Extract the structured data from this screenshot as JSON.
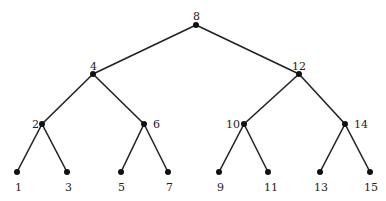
{
  "diagram": {
    "type": "binary-search-tree",
    "edge_color": "#222222",
    "node_color": "#111111",
    "nodes": [
      {
        "id": "n8",
        "label": "8",
        "x": 196,
        "y": 25,
        "lx": 193,
        "ly": 11
      },
      {
        "id": "n4",
        "label": "4",
        "x": 93,
        "y": 74,
        "lx": 90,
        "ly": 61
      },
      {
        "id": "n12",
        "label": "12",
        "x": 299,
        "y": 74,
        "lx": 292,
        "ly": 61
      },
      {
        "id": "n2",
        "label": "2",
        "x": 42,
        "y": 124,
        "lx": 32,
        "ly": 119
      },
      {
        "id": "n6",
        "label": "6",
        "x": 144,
        "y": 124,
        "lx": 153,
        "ly": 119
      },
      {
        "id": "n10",
        "label": "10",
        "x": 244,
        "y": 124,
        "lx": 226,
        "ly": 119
      },
      {
        "id": "n14",
        "label": "14",
        "x": 345,
        "y": 124,
        "lx": 354,
        "ly": 119
      },
      {
        "id": "n1",
        "label": "1",
        "x": 17,
        "y": 172,
        "lx": 15,
        "ly": 182
      },
      {
        "id": "n3",
        "label": "3",
        "x": 67,
        "y": 172,
        "lx": 65,
        "ly": 182
      },
      {
        "id": "n5",
        "label": "5",
        "x": 121,
        "y": 172,
        "lx": 118,
        "ly": 182
      },
      {
        "id": "n7",
        "label": "7",
        "x": 168,
        "y": 172,
        "lx": 166,
        "ly": 182
      },
      {
        "id": "n9",
        "label": "9",
        "x": 219,
        "y": 172,
        "lx": 217,
        "ly": 182
      },
      {
        "id": "n11",
        "label": "11",
        "x": 268,
        "y": 172,
        "lx": 264,
        "ly": 182
      },
      {
        "id": "n13",
        "label": "13",
        "x": 320,
        "y": 172,
        "lx": 314,
        "ly": 182
      },
      {
        "id": "n15",
        "label": "15",
        "x": 370,
        "y": 172,
        "lx": 364,
        "ly": 182
      }
    ],
    "edges": [
      [
        "n8",
        "n4"
      ],
      [
        "n8",
        "n12"
      ],
      [
        "n4",
        "n2"
      ],
      [
        "n4",
        "n6"
      ],
      [
        "n12",
        "n10"
      ],
      [
        "n12",
        "n14"
      ],
      [
        "n2",
        "n1"
      ],
      [
        "n2",
        "n3"
      ],
      [
        "n6",
        "n5"
      ],
      [
        "n6",
        "n7"
      ],
      [
        "n10",
        "n9"
      ],
      [
        "n10",
        "n11"
      ],
      [
        "n14",
        "n13"
      ],
      [
        "n14",
        "n15"
      ]
    ]
  }
}
